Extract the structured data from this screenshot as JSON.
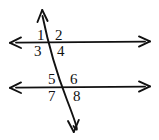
{
  "figure": {
    "background_color": "#ffffff",
    "ink_color": "#111111",
    "width": 159,
    "height": 140
  },
  "lines": {
    "upper_parallel": {
      "name": "upper horizontal line",
      "arrowheads": "both",
      "x_start": 10,
      "x_end": 150,
      "y": 42
    },
    "lower_parallel": {
      "name": "lower horizontal line",
      "arrowheads": "both",
      "x_start": 10,
      "x_end": 150,
      "y": 87
    },
    "transversal": {
      "name": "transversal line",
      "arrowheads": "both",
      "x_start": 42,
      "y_start": 10,
      "x_end": 74,
      "y_end": 132
    }
  },
  "intersections": {
    "upper": {
      "x": 51,
      "y": 42
    },
    "lower": {
      "x": 67,
      "y": 87
    }
  },
  "angle_labels": [
    {
      "id": "angle-1",
      "text": "1",
      "x": 37,
      "y": 28,
      "position": "upper-left-above"
    },
    {
      "id": "angle-2",
      "text": "2",
      "x": 55,
      "y": 28,
      "position": "upper-right-above"
    },
    {
      "id": "angle-3",
      "text": "3",
      "x": 34,
      "y": 44,
      "position": "upper-left-below"
    },
    {
      "id": "angle-4",
      "text": "4",
      "x": 57,
      "y": 44,
      "position": "upper-right-below"
    },
    {
      "id": "angle-5",
      "text": "5",
      "x": 48,
      "y": 72,
      "position": "lower-left-above"
    },
    {
      "id": "angle-6",
      "text": "6",
      "x": 70,
      "y": 72,
      "position": "lower-right-above"
    },
    {
      "id": "angle-7",
      "text": "7",
      "x": 48,
      "y": 89,
      "position": "lower-left-below"
    },
    {
      "id": "angle-8",
      "text": "8",
      "x": 73,
      "y": 89,
      "position": "lower-right-below"
    }
  ]
}
